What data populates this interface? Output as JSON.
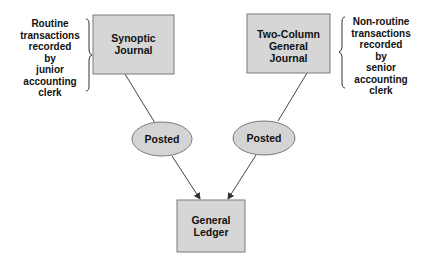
{
  "diagram": {
    "nodes": {
      "synoptic": {
        "lines": [
          "Synoptic",
          "Journal"
        ]
      },
      "two_column": {
        "lines": [
          "Two-Column",
          "General",
          "Journal"
        ]
      },
      "posted_left": {
        "label": "Posted"
      },
      "posted_right": {
        "label": "Posted"
      },
      "ledger": {
        "lines": [
          "General",
          "Ledger"
        ]
      }
    },
    "annotations": {
      "left": {
        "lines": [
          "Routine",
          "transactions",
          "recorded",
          "by",
          "junior",
          "accounting",
          "clerk"
        ]
      },
      "right": {
        "lines": [
          "Non-routine",
          "transactions",
          "recorded",
          "by",
          "senior",
          "accounting",
          "clerk"
        ]
      }
    },
    "edges": [
      {
        "from": "synoptic",
        "to": "posted_left",
        "arrow": false
      },
      {
        "from": "two_column",
        "to": "posted_right",
        "arrow": false
      },
      {
        "from": "posted_left",
        "to": "ledger",
        "arrow": true
      },
      {
        "from": "posted_right",
        "to": "ledger",
        "arrow": true
      }
    ],
    "colors": {
      "box_fill": "#d6d6d6",
      "box_stroke": "#7a7a7a",
      "ellipse_fill": "#d4d4d4",
      "line": "#333333",
      "text": "#111111"
    }
  }
}
